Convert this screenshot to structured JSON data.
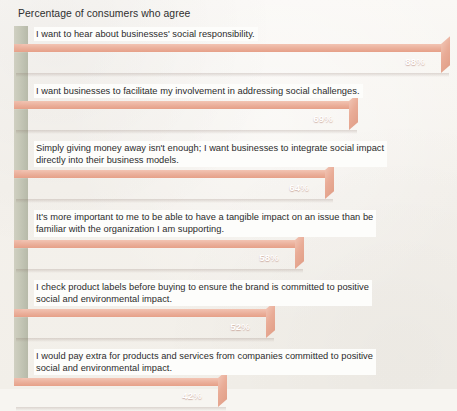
{
  "chart_data": {
    "type": "bar",
    "orientation": "horizontal",
    "title": "Percentage of consumers who agree",
    "xlabel": "",
    "ylabel": "",
    "xlim": [
      0,
      100
    ],
    "grid": false,
    "legend": null,
    "value_suffix": "%",
    "categories": [
      "I want to hear about businesses' social responsibility.",
      "I want businesses to facilitate my involvement in addressing social challenges.",
      "Simply giving money away isn't enough; I want businesses to integrate social impact directly into their business models.",
      "It's more important to me to be able to have a tangible impact on an issue than be familiar with the organization I am supporting.",
      "I check product labels before buying to ensure the brand is committed to positive social and environmental impact.",
      "I would pay extra for products and services from companies committed to positive social and environmental impact."
    ],
    "values": [
      88,
      69,
      64,
      58,
      52,
      42
    ],
    "value_labels": [
      "88%",
      "69%",
      "64%",
      "58%",
      "52%",
      "42%"
    ],
    "colors": {
      "bar_front": "#e2603d",
      "bar_top": "#eaad98",
      "bar_cap": "#e9ac97",
      "left_wall": "#bcbeae",
      "background": "#f7f5f1",
      "label_text": "#2b2b2b",
      "value_text": "#ffffff"
    }
  },
  "bars": [
    {
      "label": "I want to hear about businesses' social responsibility.",
      "label_lines": [
        "I want to hear about businesses' social responsibility."
      ],
      "value": "88%"
    },
    {
      "label": "I want businesses to facilitate my involvement in addressing social challenges.",
      "label_lines": [
        "I want businesses to facilitate my involvement in addressing social challenges."
      ],
      "value": "69%"
    },
    {
      "label": "Simply giving money away isn't enough; I want businesses to integrate social impact directly into their business models.",
      "label_lines": [
        "Simply giving money away isn't enough; I want businesses to integrate social impact",
        "directly into their business models."
      ],
      "value": "64%"
    },
    {
      "label": "It's more important to me to be able to have a tangible impact on an issue than be familiar with the organization I am supporting.",
      "label_lines": [
        "It's more important to me to be able to have a tangible impact on an issue than be",
        "familiar with the organization I am supporting."
      ],
      "value": "58%"
    },
    {
      "label": "I check product labels before buying to ensure the brand is committed to positive social and environmental impact.",
      "label_lines": [
        "I check product labels before buying to ensure the brand is committed to positive",
        "social and environmental impact."
      ],
      "value": "52%"
    },
    {
      "label": "I would pay extra for products and services from companies committed to positive social and environmental impact.",
      "label_lines": [
        "I would pay extra for products and services from companies committed to positive",
        "social and environmental impact."
      ],
      "value": "42%"
    }
  ]
}
